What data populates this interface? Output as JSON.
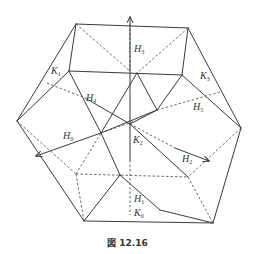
{
  "figure": {
    "caption": "図 12.16",
    "labels": {
      "H0": {
        "base": "H",
        "sub": "0"
      },
      "H1": {
        "base": "H",
        "sub": "1"
      },
      "H2": {
        "base": "H",
        "sub": "2"
      },
      "H3": {
        "base": "H",
        "sub": "3"
      },
      "H4": {
        "base": "H",
        "sub": "4"
      },
      "H5": {
        "base": "H",
        "sub": "5"
      },
      "K0": {
        "base": "K",
        "sub": "0"
      },
      "K1": {
        "base": "K",
        "sub": "1"
      },
      "K2": {
        "base": "K",
        "sub": "2"
      },
      "K3": {
        "base": "K",
        "sub": "3"
      }
    }
  }
}
